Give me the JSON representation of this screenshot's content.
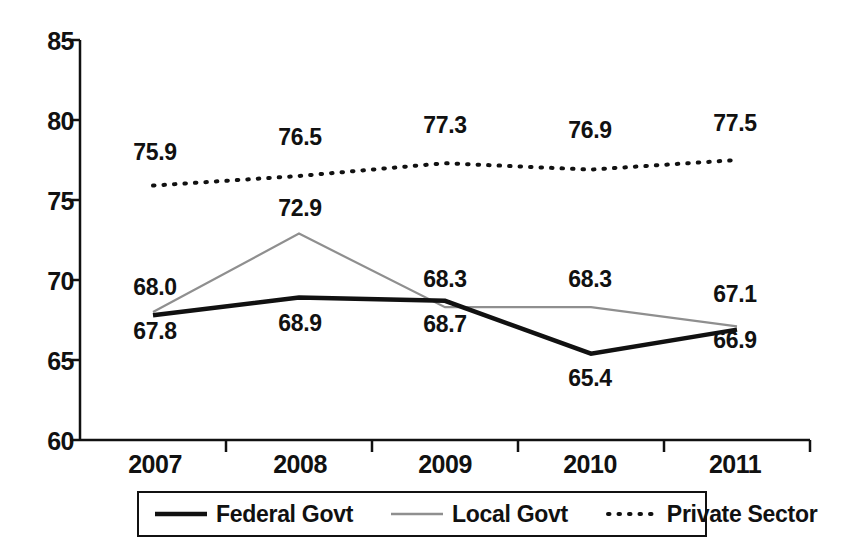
{
  "chart_data": {
    "type": "line",
    "title": "",
    "subtitle": "",
    "xlabel": "",
    "ylabel": "",
    "categories": [
      "2007",
      "2008",
      "2009",
      "2010",
      "2011"
    ],
    "ylim": [
      60,
      85
    ],
    "yticks": [
      "60",
      "65",
      "70",
      "75",
      "80",
      "85"
    ],
    "grid": false,
    "legend_position": "bottom",
    "series": [
      {
        "name": "Federal Govt",
        "style": "solid",
        "color": "#111111",
        "values": [
          67.8,
          68.9,
          68.7,
          65.4,
          66.9
        ],
        "labels": [
          "67.8",
          "68.9",
          "68.7",
          "65.4",
          "66.9"
        ]
      },
      {
        "name": "Local Govt",
        "style": "thin-gray",
        "color": "#8a8a8a",
        "values": [
          68.0,
          72.9,
          68.3,
          68.3,
          67.1
        ],
        "labels": [
          "68.0",
          "72.9",
          "68.3",
          "68.3",
          "67.1"
        ]
      },
      {
        "name": "Private Sector",
        "style": "dotted",
        "color": "#111111",
        "values": [
          75.9,
          76.5,
          77.3,
          76.9,
          77.5
        ],
        "labels": [
          "75.9",
          "76.5",
          "77.3",
          "76.9",
          "77.5"
        ]
      }
    ]
  },
  "axis": {
    "y_ticks": [
      {
        "label": "85"
      },
      {
        "label": "80"
      },
      {
        "label": "75"
      },
      {
        "label": "70"
      },
      {
        "label": "65"
      },
      {
        "label": "60"
      }
    ],
    "x_ticks": [
      {
        "label": "2007"
      },
      {
        "label": "2008"
      },
      {
        "label": "2009"
      },
      {
        "label": "2010"
      },
      {
        "label": "2011"
      }
    ]
  },
  "legend": {
    "items": [
      {
        "label": "Federal Govt",
        "icon": "solid-line-swatch"
      },
      {
        "label": "Local Govt",
        "icon": "thin-gray-line-swatch"
      },
      {
        "label": "Private Sector",
        "icon": "dotted-line-swatch"
      }
    ]
  },
  "data_labels": {
    "federal": [
      {
        "text": "67.8",
        "x": 110,
        "y": 318
      },
      {
        "text": "68.9",
        "x": 255,
        "y": 310
      },
      {
        "text": "68.7",
        "x": 400,
        "y": 311
      },
      {
        "text": "65.4",
        "x": 545,
        "y": 365
      },
      {
        "text": "66.9",
        "x": 690,
        "y": 327
      }
    ],
    "local": [
      {
        "text": "68.0",
        "x": 110,
        "y": 274
      },
      {
        "text": "72.9",
        "x": 255,
        "y": 195
      },
      {
        "text": "68.3",
        "x": 400,
        "y": 266
      },
      {
        "text": "68.3",
        "x": 545,
        "y": 266
      },
      {
        "text": "67.1",
        "x": 690,
        "y": 281
      }
    ],
    "private": [
      {
        "text": "75.9",
        "x": 110,
        "y": 139
      },
      {
        "text": "76.5",
        "x": 255,
        "y": 124
      },
      {
        "text": "77.3",
        "x": 400,
        "y": 112
      },
      {
        "text": "76.9",
        "x": 545,
        "y": 117
      },
      {
        "text": "77.5",
        "x": 690,
        "y": 110
      }
    ]
  }
}
